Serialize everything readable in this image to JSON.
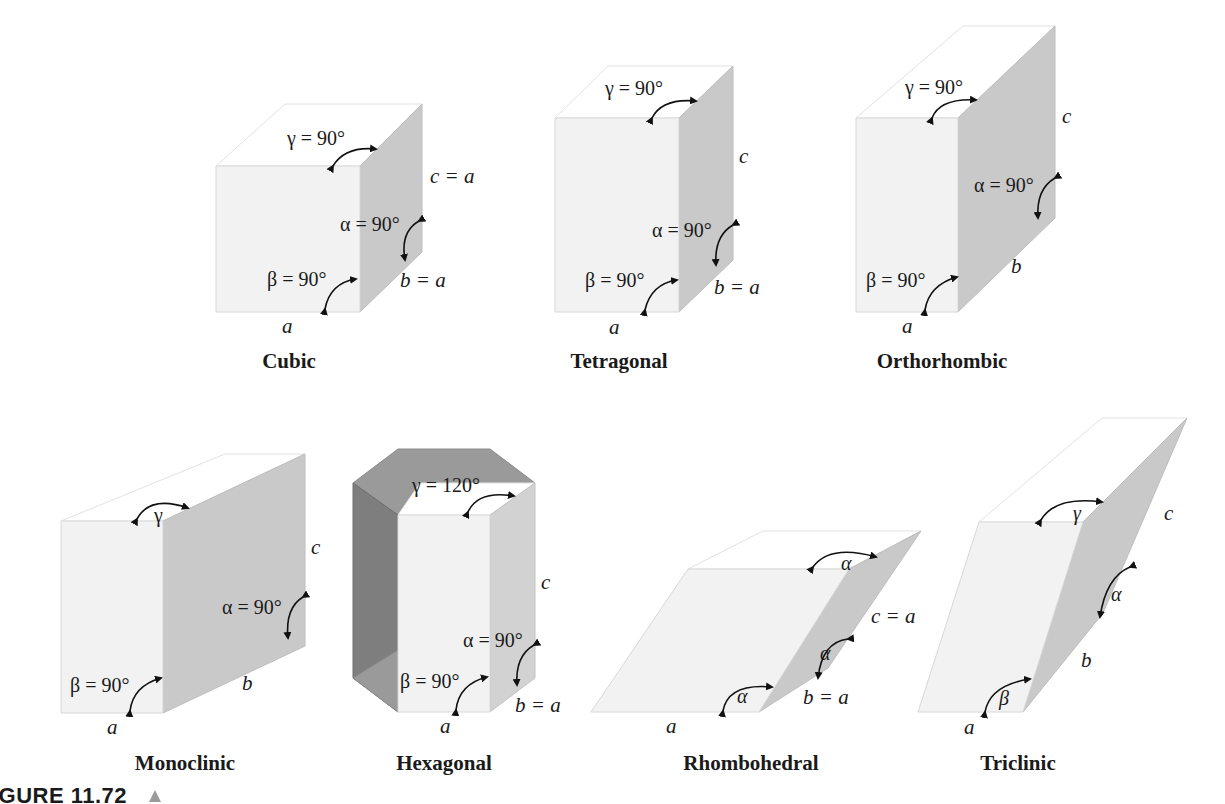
{
  "figure": {
    "caption_number": "FIGURE 11.72",
    "caption_marker": "triangle"
  },
  "systems": [
    {
      "name": "Cubic",
      "edge_a": "a",
      "edge_b": "b = a",
      "edge_c": "c = a",
      "alpha": "α = 90°",
      "beta": "β = 90°",
      "gamma": "γ = 90°"
    },
    {
      "name": "Tetragonal",
      "edge_a": "a",
      "edge_b": "b = a",
      "edge_c": "c",
      "alpha": "α = 90°",
      "beta": "β = 90°",
      "gamma": "γ = 90°"
    },
    {
      "name": "Orthorhombic",
      "edge_a": "a",
      "edge_b": "b",
      "edge_c": "c",
      "alpha": "α = 90°",
      "beta": "β = 90°",
      "gamma": "γ = 90°"
    },
    {
      "name": "Monoclinic",
      "edge_a": "a",
      "edge_b": "b",
      "edge_c": "c",
      "alpha": "α = 90°",
      "beta": "β = 90°",
      "gamma": "γ"
    },
    {
      "name": "Hexagonal",
      "edge_a": "a",
      "edge_b": "b = a",
      "edge_c": "c",
      "alpha": "α = 90°",
      "beta": "β = 90°",
      "gamma": "γ = 120°"
    },
    {
      "name": "Rhombohedral",
      "edge_a": "a",
      "edge_b": "b = a",
      "edge_c": "c = a",
      "alpha": "α",
      "beta": "α",
      "gamma": "α"
    },
    {
      "name": "Triclinic",
      "edge_a": "a",
      "edge_b": "b",
      "edge_c": "c",
      "alpha": "α",
      "beta": "β",
      "gamma": "γ"
    }
  ]
}
